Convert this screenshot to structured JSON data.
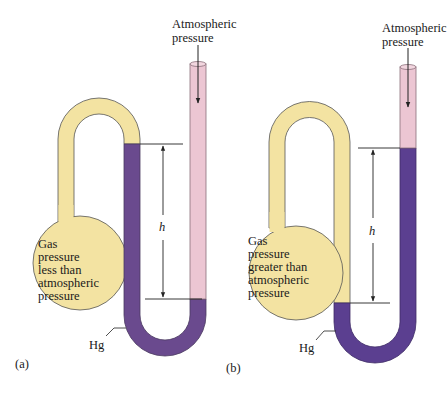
{
  "colors": {
    "gas_yellow": "#f3e3a2",
    "mercury_purple": "#6a4a8e",
    "mercury_purple_b": "#5b3f90",
    "air_pink": "#ecc6d3",
    "outline": "#4a4a4a",
    "line": "#222222"
  },
  "panel_a": {
    "caption": "(a)",
    "atmospheric_label_line1": "Atmospheric",
    "atmospheric_label_line2": "pressure",
    "bulb_text": [
      "Gas",
      "pressure",
      "less than",
      "atmospheric",
      "pressure"
    ],
    "height_label": "h",
    "mercury_label": "Hg"
  },
  "panel_b": {
    "caption": "(b)",
    "atmospheric_label_line1": "Atmospheric",
    "atmospheric_label_line2": "pressure",
    "bulb_text": [
      "Gas",
      "pressure",
      "greater than",
      "atmospheric",
      "pressure"
    ],
    "height_label": "h",
    "mercury_label": "Hg"
  }
}
